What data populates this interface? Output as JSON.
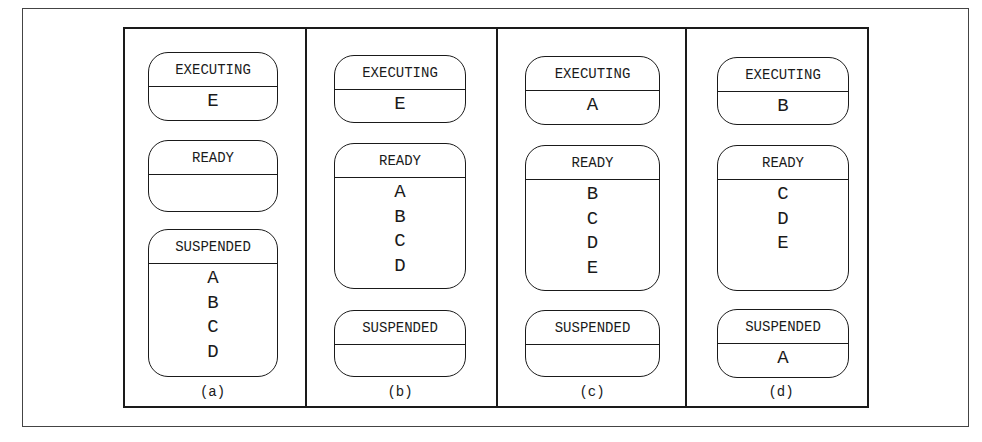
{
  "figure": {
    "panels": [
      {
        "label": "(a)",
        "executing": {
          "title": "EXECUTING",
          "items": [
            "E"
          ]
        },
        "ready": {
          "title": "READY",
          "items": []
        },
        "suspended": {
          "title": "SUSPENDED",
          "items": [
            "A",
            "B",
            "C",
            "D"
          ]
        }
      },
      {
        "label": "(b)",
        "executing": {
          "title": "EXECUTING",
          "items": [
            "E"
          ]
        },
        "ready": {
          "title": "READY",
          "items": [
            "A",
            "B",
            "C",
            "D"
          ]
        },
        "suspended": {
          "title": "SUSPENDED",
          "items": []
        }
      },
      {
        "label": "(c)",
        "executing": {
          "title": "EXECUTING",
          "items": [
            "A"
          ]
        },
        "ready": {
          "title": "READY",
          "items": [
            "B",
            "C",
            "D",
            "E"
          ]
        },
        "suspended": {
          "title": "SUSPENDED",
          "items": []
        }
      },
      {
        "label": "(d)",
        "executing": {
          "title": "EXECUTING",
          "items": [
            "B"
          ]
        },
        "ready": {
          "title": "READY",
          "items": [
            "C",
            "D",
            "E"
          ]
        },
        "suspended": {
          "title": "SUSPENDED",
          "items": [
            "A"
          ]
        }
      }
    ]
  }
}
